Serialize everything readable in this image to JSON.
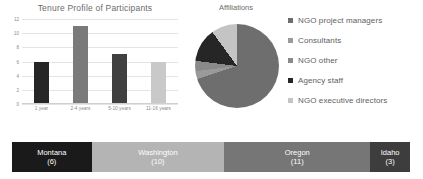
{
  "chart_data": [
    {
      "type": "bar",
      "title": "Tenure Profile of Participants",
      "categories": [
        "1 year",
        "2-4 years",
        "5-10 years",
        "11-16 years"
      ],
      "values": [
        6,
        11,
        7,
        6
      ],
      "colors": [
        "#262626",
        "#7a7a7a",
        "#404040",
        "#c9c9c9"
      ],
      "xlabel": "",
      "ylabel": "",
      "ylim": [
        0,
        12
      ],
      "yticks": [
        "0",
        "2",
        "4",
        "6",
        "8",
        "10",
        "12"
      ],
      "grid": true,
      "legend": "none"
    },
    {
      "type": "pie",
      "title": "Affiliations",
      "labels": [
        "NGO project managers",
        "Consultants",
        "NGO other",
        "Agency staff",
        "NGO executive directors"
      ],
      "values": [
        70,
        3,
        4,
        13,
        10
      ],
      "colors": [
        "#6e6e6e",
        "#9a9a9a",
        "#8a8a8a",
        "#262626",
        "#c4c4c4"
      ],
      "legend_position": "right"
    },
    {
      "type": "bar",
      "title": "",
      "orientation": "stacked-horizontal",
      "categories": [
        "Montana",
        "Washington",
        "Oregon",
        "Idaho"
      ],
      "values": [
        6,
        10,
        11,
        3
      ],
      "colors": [
        "#1a1a1a",
        "#b4b4b4",
        "#767676",
        "#3d3d3d"
      ],
      "label_format": "name (count)"
    }
  ],
  "bar_chart": {
    "title": "Tenure Profile of Participants",
    "yticks": [
      "12",
      "10",
      "8",
      "6",
      "4",
      "2",
      "0"
    ],
    "bars": [
      {
        "label": "1 year",
        "value": 6,
        "color": "#262626"
      },
      {
        "label": "2-4 years",
        "value": 11,
        "color": "#7a7a7a"
      },
      {
        "label": "5-10 years",
        "value": 7,
        "color": "#404040"
      },
      {
        "label": "11-16 years",
        "value": 6,
        "color": "#c9c9c9"
      }
    ]
  },
  "pie_chart": {
    "title": "Affiliations",
    "slices": [
      {
        "label": "NGO project managers",
        "value": 70,
        "color": "#6e6e6e"
      },
      {
        "label": "Consultants",
        "value": 3,
        "color": "#9a9a9a"
      },
      {
        "label": "NGO other",
        "value": 4,
        "color": "#8a8a8a"
      },
      {
        "label": "Agency staff",
        "value": 13,
        "color": "#262626"
      },
      {
        "label": "NGO executive directors",
        "value": 10,
        "color": "#c4c4c4"
      }
    ]
  },
  "state_bar": {
    "segments": [
      {
        "name": "Montana",
        "count": "(6)",
        "value": 6,
        "color": "#1a1a1a"
      },
      {
        "name": "Washington",
        "count": "(10)",
        "value": 10,
        "color": "#b4b4b4"
      },
      {
        "name": "Oregon",
        "count": "(11)",
        "value": 11,
        "color": "#767676"
      },
      {
        "name": "Idaho",
        "count": "(3)",
        "value": 3,
        "color": "#3d3d3d"
      }
    ]
  }
}
